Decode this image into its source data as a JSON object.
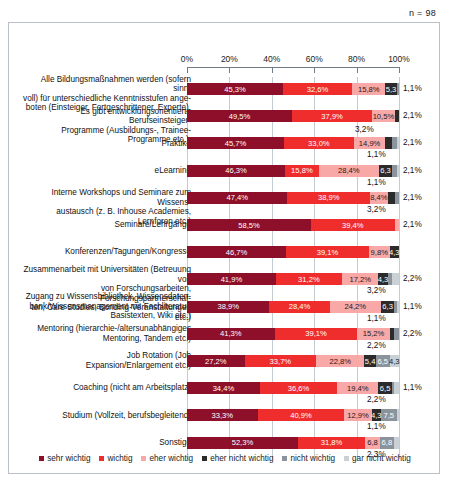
{
  "n_label": "n = 98",
  "axis": {
    "ticks": [
      "0%",
      "20%",
      "40%",
      "60%",
      "80%",
      "100%"
    ],
    "values": [
      0,
      20,
      40,
      60,
      80,
      100
    ]
  },
  "legend": [
    {
      "label": "sehr wichtig",
      "color": "#8d0f2a"
    },
    {
      "label": "wichtig",
      "color": "#ef2d2d"
    },
    {
      "label": "eher wichtig",
      "color": "#f9a8a8"
    },
    {
      "label": "eher nicht wichtig",
      "color": "#2b2b2b"
    },
    {
      "label": "nicht wichtig",
      "color": "#8b949c"
    },
    {
      "label": "gar nicht wichtig",
      "color": "#c9d0d6"
    }
  ],
  "chart_data": {
    "type": "bar",
    "orientation": "horizontal",
    "stacked": "100-percent",
    "title": "",
    "subtitle": "",
    "xlabel": "",
    "ylabel": "",
    "xlim": [
      0,
      100
    ],
    "grid": true,
    "legend_position": "bottom",
    "series": [
      {
        "name": "sehr wichtig",
        "color": "#8d0f2a",
        "values": [
          45.3,
          49.5,
          45.7,
          46.3,
          47.4,
          58.5,
          46.7,
          41.9,
          38.9,
          41.3,
          27.2,
          34.4,
          33.3,
          52.3
        ]
      },
      {
        "name": "wichtig",
        "color": "#ef2d2d",
        "values": [
          32.6,
          37.9,
          33.0,
          15.8,
          38.9,
          39.4,
          39.1,
          31.2,
          28.4,
          39.1,
          33.7,
          36.6,
          40.9,
          31.8
        ]
      },
      {
        "name": "eher wichtig",
        "color": "#f9a8a8",
        "values": [
          15.8,
          10.5,
          14.9,
          28.4,
          8.4,
          2.1,
          9.8,
          17.2,
          24.2,
          15.2,
          22.8,
          19.4,
          12.9,
          6.8
        ]
      },
      {
        "name": "eher nicht wichtig",
        "color": "#2b2b2b",
        "values": [
          5.3,
          2.1,
          3.2,
          6.3,
          3.2,
          0,
          4.3,
          4.3,
          6.3,
          2.2,
          5.4,
          6.5,
          4.3,
          6.8
        ]
      },
      {
        "name": "nicht wichtig",
        "color": "#8b949c",
        "values": [
          1.1,
          0,
          2.1,
          2.1,
          2.1,
          0,
          0,
          2.2,
          1.1,
          2.2,
          6.5,
          1.1,
          7.5,
          2.3
        ]
      },
      {
        "name": "gar nicht wichtig",
        "color": "#c9d0d6",
        "values": [
          0,
          0,
          1.1,
          1.1,
          0,
          0,
          0,
          3.2,
          1.1,
          0,
          4.3,
          2.2,
          1.1,
          0
        ]
      }
    ],
    "categories": [
      "Alle Bildungsmaßnahmen werden (sofern sinnvoll) für unterschiedliche Kenntnisstufen angeboten (Einsteiger, Fortgeschrittener, Experte).",
      "Es gibt entwicklungsorientierte Berufseinsteiger-Programme (Ausbildungs-, Trainee-Programme etc.).",
      "Praktika",
      "eLearning",
      "Interne Workshops und Seminare zum Wissensaustausch (z. B. Inhouse Academies, Lernforen etc.)",
      "Seminare/Lehrgänge",
      "Konferenzen/Tagungen/Kongresse",
      "Zusammenarbeit mit Universitäten (Betreuung von von Forschungsarbeiten, Forschungspartnerschaften, Care Studies, Bonding-Veranstaltungen etc.)",
      "Zugang zu Wissensbibliothek, Wissensdatenbank/Wissensmanagement mit Fachliteratur, Basistexten, Wiki etc.)",
      "Mentoring (hierarchie-/altersunabhängiges Mentoring, Tandem etc.)",
      "Job Rotation (Job Expansion/Enlargement etc.)",
      "Coaching (nicht am Arbeitsplatz)",
      "Studium (Vollzeit, berufsbegleitend)",
      "Sonstige"
    ]
  },
  "rows": [
    {
      "label_lines": [
        "Alle Bildungsmaßnahmen werden (sofern sinn-",
        "voll) für unterschiedliche Kenntnisstufen ange-",
        "boten (Einsteiger, Fortgeschrittener, Experte)."
      ],
      "segments": [
        {
          "cls": "c0",
          "value": 45.3,
          "text": "45,3%"
        },
        {
          "cls": "c1",
          "value": 32.6,
          "text": "32,6%"
        },
        {
          "cls": "c2",
          "value": 15.8,
          "text": "15,8%"
        },
        {
          "cls": "c3",
          "value": 5.3,
          "text": "5,3"
        },
        {
          "cls": "c4",
          "value": 1.1,
          "text": ""
        }
      ],
      "outer": "1,1%",
      "above": ""
    },
    {
      "label_lines": [
        "Es gibt entwicklungsorientierte Berufseinsteiger-",
        "Programme (Ausbildungs-, Trainee-Programme etc.)."
      ],
      "segments": [
        {
          "cls": "c0",
          "value": 49.5,
          "text": "49,5%"
        },
        {
          "cls": "c1",
          "value": 37.9,
          "text": "37,9%"
        },
        {
          "cls": "c2",
          "value": 10.5,
          "text": "10,5%"
        },
        {
          "cls": "c3",
          "value": 2.1,
          "text": ""
        }
      ],
      "outer": "2,1%",
      "above": ""
    },
    {
      "label_lines": [
        "Praktika"
      ],
      "segments": [
        {
          "cls": "c0",
          "value": 45.7,
          "text": "45,7%"
        },
        {
          "cls": "c1",
          "value": 33.0,
          "text": "33,0%"
        },
        {
          "cls": "c2",
          "value": 14.9,
          "text": "14,9%"
        },
        {
          "cls": "c3",
          "value": 3.2,
          "text": ""
        },
        {
          "cls": "c4",
          "value": 2.1,
          "text": ""
        },
        {
          "cls": "c5",
          "value": 1.1,
          "text": ""
        }
      ],
      "outer": "2,1%",
      "above": "3,2%",
      "below": "1,1%"
    },
    {
      "label_lines": [
        "eLearning"
      ],
      "segments": [
        {
          "cls": "c0",
          "value": 46.3,
          "text": "46,3%"
        },
        {
          "cls": "c1",
          "value": 15.8,
          "text": "15,8%"
        },
        {
          "cls": "c2",
          "value": 28.4,
          "text": "28,4%"
        },
        {
          "cls": "c3",
          "value": 6.3,
          "text": "6,3"
        },
        {
          "cls": "c4",
          "value": 2.1,
          "text": ""
        },
        {
          "cls": "c5",
          "value": 1.1,
          "text": ""
        }
      ],
      "outer": "2,1%",
      "below": "1,1%"
    },
    {
      "label_lines": [
        "Interne Workshops und Seminare zum Wissens-",
        "austausch (z. B. Inhouse Academies, Lernforen etc.)"
      ],
      "segments": [
        {
          "cls": "c0",
          "value": 47.4,
          "text": "47,4%"
        },
        {
          "cls": "c1",
          "value": 38.9,
          "text": "38,9%"
        },
        {
          "cls": "c2",
          "value": 8.4,
          "text": "8,4%"
        },
        {
          "cls": "c3",
          "value": 3.2,
          "text": ""
        },
        {
          "cls": "c4",
          "value": 2.1,
          "text": ""
        }
      ],
      "outer": "2,1%",
      "below": "3,2%"
    },
    {
      "label_lines": [
        "Seminare/Lehrgänge"
      ],
      "segments": [
        {
          "cls": "c0",
          "value": 58.5,
          "text": "58,5%"
        },
        {
          "cls": "c1",
          "value": 39.4,
          "text": "39,4%"
        },
        {
          "cls": "c2",
          "value": 2.1,
          "text": ""
        }
      ],
      "outer": "2,1%",
      "above": ""
    },
    {
      "label_lines": [
        "Konferenzen/Tagungen/Kongresse"
      ],
      "segments": [
        {
          "cls": "c0",
          "value": 46.7,
          "text": "46,7%"
        },
        {
          "cls": "c1",
          "value": 39.1,
          "text": "39,1%"
        },
        {
          "cls": "c2",
          "value": 9.8,
          "text": "9,8%"
        },
        {
          "cls": "c3",
          "value": 4.3,
          "text": "4,3"
        }
      ],
      "outer": "",
      "above": ""
    },
    {
      "label_lines": [
        "Zusammenarbeit mit Universitäten (Betreuung von",
        "von Forschungsarbeiten, Forschungspartnerschaf-",
        "ten, Care Studies, Bonding-Veranstaltungen etc.)"
      ],
      "segments": [
        {
          "cls": "c0",
          "value": 41.9,
          "text": "41,9%"
        },
        {
          "cls": "c1",
          "value": 31.2,
          "text": "31,2%"
        },
        {
          "cls": "c2",
          "value": 17.2,
          "text": "17,2%"
        },
        {
          "cls": "c3",
          "value": 4.3,
          "text": "4,3"
        },
        {
          "cls": "c4",
          "value": 2.2,
          "text": ""
        },
        {
          "cls": "c5",
          "value": 3.2,
          "text": ""
        }
      ],
      "outer": "2,2%",
      "below": "3,2%"
    },
    {
      "label_lines": [
        "Zugang zu Wissensbibliothek, Wissensdaten-",
        "bank/Wissensmanagement mit Fachliteratur,",
        "Basistexten, Wiki etc.)"
      ],
      "segments": [
        {
          "cls": "c0",
          "value": 38.9,
          "text": "38,9%"
        },
        {
          "cls": "c1",
          "value": 28.4,
          "text": "28,4%"
        },
        {
          "cls": "c2",
          "value": 24.2,
          "text": "24,2%"
        },
        {
          "cls": "c3",
          "value": 6.3,
          "text": "6,3"
        },
        {
          "cls": "c4",
          "value": 1.1,
          "text": ""
        },
        {
          "cls": "c5",
          "value": 1.1,
          "text": ""
        }
      ],
      "outer": "1,1%",
      "below": "1,1%"
    },
    {
      "label_lines": [
        "Mentoring (hierarchie-/altersunabhängiges",
        "Mentoring, Tandem etc.)"
      ],
      "segments": [
        {
          "cls": "c0",
          "value": 41.3,
          "text": "41,3%"
        },
        {
          "cls": "c1",
          "value": 39.1,
          "text": "39,1%"
        },
        {
          "cls": "c2",
          "value": 15.2,
          "text": "15,2%"
        },
        {
          "cls": "c3",
          "value": 2.2,
          "text": ""
        },
        {
          "cls": "c4",
          "value": 2.2,
          "text": ""
        }
      ],
      "outer": "2,2%",
      "below": "2,2%"
    },
    {
      "label_lines": [
        "Job Rotation (Job",
        "Expansion/Enlargement etc.)"
      ],
      "segments": [
        {
          "cls": "c0",
          "value": 27.2,
          "text": "27,2%"
        },
        {
          "cls": "c1",
          "value": 33.7,
          "text": "33,7%"
        },
        {
          "cls": "c2",
          "value": 22.8,
          "text": "22,8%"
        },
        {
          "cls": "c3",
          "value": 5.4,
          "text": "5,4"
        },
        {
          "cls": "c4",
          "value": 6.5,
          "text": "6,5"
        },
        {
          "cls": "c5",
          "value": 4.3,
          "text": "4,3"
        }
      ],
      "outer": "",
      "above": ""
    },
    {
      "label_lines": [
        "Coaching (nicht am Arbeitsplatz)"
      ],
      "segments": [
        {
          "cls": "c0",
          "value": 34.4,
          "text": "34,4%"
        },
        {
          "cls": "c1",
          "value": 36.6,
          "text": "36,6%"
        },
        {
          "cls": "c2",
          "value": 19.4,
          "text": "19,4%"
        },
        {
          "cls": "c3",
          "value": 6.5,
          "text": "6,5"
        },
        {
          "cls": "c4",
          "value": 1.1,
          "text": ""
        },
        {
          "cls": "c5",
          "value": 2.2,
          "text": ""
        }
      ],
      "outer": "1,1%",
      "below": "2,2%"
    },
    {
      "label_lines": [
        "Studium (Vollzeit, berufsbegleitend)"
      ],
      "segments": [
        {
          "cls": "c0",
          "value": 33.3,
          "text": "33,3%"
        },
        {
          "cls": "c1",
          "value": 40.9,
          "text": "40,9%"
        },
        {
          "cls": "c2",
          "value": 12.9,
          "text": "12,9%"
        },
        {
          "cls": "c3",
          "value": 4.3,
          "text": "4,3"
        },
        {
          "cls": "c4",
          "value": 7.5,
          "text": "7,5"
        },
        {
          "cls": "c5",
          "value": 1.1,
          "text": ""
        }
      ],
      "outer": "",
      "below": "1,1%"
    },
    {
      "label_lines": [
        "Sonstige"
      ],
      "segments": [
        {
          "cls": "c0",
          "value": 52.3,
          "text": "52,3%"
        },
        {
          "cls": "c1",
          "value": 31.8,
          "text": "31,8%"
        },
        {
          "cls": "c2",
          "value": 6.8,
          "text": "6,8"
        },
        {
          "cls": "c4",
          "value": 6.8,
          "text": "6,8"
        },
        {
          "cls": "c5",
          "value": 2.3,
          "text": ""
        }
      ],
      "outer": "",
      "below": "2,3%"
    }
  ]
}
